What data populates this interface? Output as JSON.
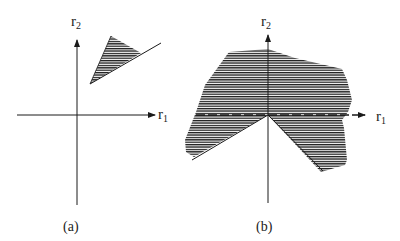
{
  "figure": {
    "panels": [
      {
        "id": "a",
        "caption": "(a)",
        "x_axis_label": "r",
        "x_axis_sub": "1",
        "y_axis_label": "r",
        "y_axis_sub": "2",
        "shaded_region": "narrow cone in first quadrant, offset from origin"
      },
      {
        "id": "b",
        "caption": "(b)",
        "x_axis_label": "r",
        "x_axis_sub": "1",
        "y_axis_label": "r",
        "y_axis_sub": "2",
        "shaded_region": "large irregular region containing the origin, excluding a downward wedge"
      }
    ],
    "colors": {
      "ink": "#1a1a1a",
      "background": "#ffffff"
    }
  }
}
